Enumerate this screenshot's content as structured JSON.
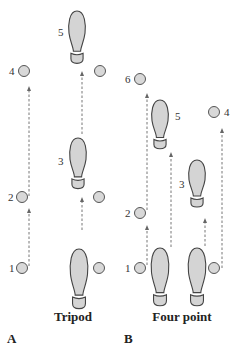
{
  "panels": [
    {
      "id": "A",
      "letter": "A",
      "caption": "Tripod",
      "crutches": [
        {
          "label": "1",
          "x": 22,
          "y": 268,
          "labelX": 9,
          "labelY": 272
        },
        {
          "label": "2",
          "x": 22,
          "y": 197,
          "labelX": 8,
          "labelY": 201
        },
        {
          "label": "4",
          "x": 24,
          "y": 71,
          "labelX": 9,
          "labelY": 75
        },
        {
          "x": 99,
          "y": 268
        },
        {
          "x": 99,
          "y": 197
        },
        {
          "x": 100,
          "y": 71
        }
      ],
      "feet": [
        {
          "cx": 79,
          "toeY": 249,
          "len": 64,
          "w": 17
        },
        {
          "cx": 78,
          "toeY": 138,
          "len": 54,
          "w": 16,
          "label": "3",
          "labelX": 58,
          "labelY": 165
        },
        {
          "cx": 77,
          "toeY": 11,
          "len": 56,
          "w": 16,
          "label": "5",
          "labelX": 58,
          "labelY": 36
        }
      ],
      "paths": [
        {
          "x": 29,
          "y1": 266,
          "y2": 208
        },
        {
          "x": 29,
          "y1": 196,
          "y2": 86
        },
        {
          "x": 82,
          "y1": 230,
          "y2": 197
        },
        {
          "x": 82,
          "y1": 134,
          "y2": 71
        }
      ],
      "captionX": 73,
      "captionY": 321,
      "letterX": 7,
      "letterY": 343
    },
    {
      "id": "B",
      "letter": "B",
      "caption": "Four point",
      "crutches": [
        {
          "label": "1",
          "x": 140,
          "y": 268,
          "labelX": 125,
          "labelY": 272
        },
        {
          "label": "2",
          "x": 140,
          "y": 213,
          "labelX": 125,
          "labelY": 217
        },
        {
          "label": "6",
          "x": 140,
          "y": 79,
          "labelX": 125,
          "labelY": 83
        },
        {
          "label": "4",
          "x": 214,
          "y": 112,
          "labelX": 224,
          "labelY": 116
        },
        {
          "x": 214,
          "y": 268
        }
      ],
      "feet": [
        {
          "cx": 160,
          "toeY": 248,
          "len": 62,
          "w": 17
        },
        {
          "cx": 197,
          "toeY": 248,
          "len": 62,
          "w": 17
        },
        {
          "cx": 160,
          "toeY": 100,
          "len": 52,
          "w": 16,
          "label": "5",
          "labelX": 175,
          "labelY": 120
        },
        {
          "cx": 197,
          "toeY": 160,
          "len": 50,
          "w": 16,
          "label": "3",
          "labelX": 179,
          "labelY": 188
        }
      ],
      "paths": [
        {
          "x": 147,
          "y1": 265,
          "y2": 225
        },
        {
          "x": 147,
          "y1": 210,
          "y2": 93
        },
        {
          "x": 171,
          "y1": 247,
          "y2": 152
        },
        {
          "x": 205,
          "y1": 246,
          "y2": 218
        },
        {
          "x": 222,
          "y1": 268,
          "y2": 128
        }
      ],
      "captionX": 182,
      "captionY": 321,
      "letterX": 124,
      "letterY": 343
    }
  ],
  "colors": {
    "fill": "#d4d4d4",
    "stroke": "#444444",
    "path": "#777777"
  }
}
